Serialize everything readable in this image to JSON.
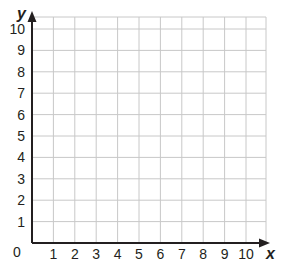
{
  "chart_data": {
    "type": "scatter",
    "title": "",
    "xlabel": "x",
    "ylabel": "y",
    "xlim": [
      0,
      10
    ],
    "ylim": [
      0,
      10
    ],
    "grid": true,
    "x_ticks": [
      "1",
      "2",
      "3",
      "4",
      "5",
      "6",
      "7",
      "8",
      "9",
      "10"
    ],
    "y_ticks": [
      "1",
      "2",
      "3",
      "4",
      "5",
      "6",
      "7",
      "8",
      "9",
      "10"
    ],
    "origin_label": "0",
    "series": [],
    "legend": null
  },
  "colors": {
    "grid": "#c8c8c8",
    "axis": "#231f20",
    "background": "#ffffff"
  }
}
